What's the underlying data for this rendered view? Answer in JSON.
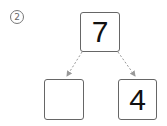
{
  "problem_number": "2",
  "problem_marker": "②",
  "diagram": {
    "type": "number-bond",
    "top": "7",
    "bottom_left": "",
    "bottom_right": "4"
  },
  "colors": {
    "border": "#666666",
    "arrow": "#999999",
    "text": "#111111"
  }
}
